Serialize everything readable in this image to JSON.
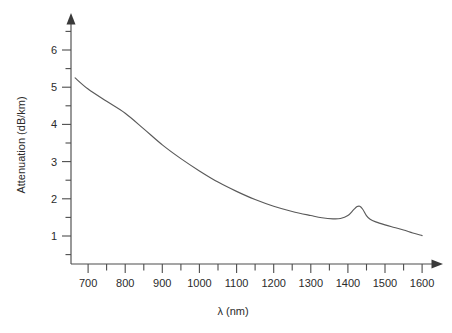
{
  "chart_data": {
    "type": "line",
    "title": "",
    "subtitle": "",
    "xlabel": "λ (nm)",
    "ylabel": "Attenuation (dB/km)",
    "xlim": [
      660,
      1625
    ],
    "ylim": [
      0,
      6.75
    ],
    "grid": false,
    "legend": null,
    "legend_position": "none",
    "x_major_ticks": [
      700,
      800,
      900,
      1000,
      1100,
      1200,
      1300,
      1400,
      1500,
      1600
    ],
    "x_minor_ticks": [
      750,
      850,
      950,
      1050,
      1150,
      1250,
      1350,
      1450,
      1550
    ],
    "x_tick_labels": [
      "700",
      "800",
      "900",
      "1000",
      "1100",
      "1200",
      "1300",
      "1400",
      "1500",
      "1600"
    ],
    "y_major_ticks": [
      1,
      2,
      3,
      4,
      5,
      6
    ],
    "y_minor_ticks": [
      1.5,
      2.5,
      3.5,
      4.5,
      5.5,
      6.5
    ],
    "y_tick_labels": [
      "1",
      "2",
      "3",
      "4",
      "5",
      "6"
    ],
    "annotations": [],
    "series": [
      {
        "name": "Attenuation",
        "color": "#5a5a5a",
        "x": [
          665,
          700,
          750,
          800,
          850,
          900,
          950,
          1000,
          1050,
          1100,
          1150,
          1200,
          1250,
          1300,
          1330,
          1360,
          1380,
          1400,
          1415,
          1425,
          1432,
          1440,
          1450,
          1460,
          1475,
          1500,
          1525,
          1550,
          1575,
          1600
        ],
        "y": [
          5.25,
          4.95,
          4.62,
          4.3,
          3.88,
          3.45,
          3.08,
          2.75,
          2.45,
          2.2,
          1.98,
          1.8,
          1.66,
          1.55,
          1.49,
          1.46,
          1.47,
          1.55,
          1.7,
          1.79,
          1.8,
          1.72,
          1.55,
          1.45,
          1.38,
          1.3,
          1.23,
          1.16,
          1.08,
          1.01
        ]
      }
    ]
  },
  "axes": {
    "x_label": "λ (nm)",
    "y_label": "Attenuation (dB/km)"
  },
  "colors": {
    "curve": "#5a5a5a",
    "axis": "#4d4d4d",
    "text": "#2b2b2b",
    "background": "#ffffff"
  }
}
